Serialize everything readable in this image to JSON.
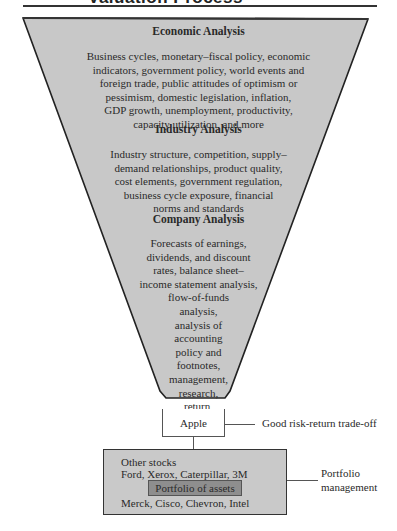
{
  "header": {
    "title": "Valuation Process"
  },
  "funnel": {
    "fill_color": "#c8c8c8",
    "stroke_color": "#222222",
    "sections": [
      {
        "heading": "Economic Analysis",
        "lines": [
          "Business cycles, monetary–fiscal policy, economic",
          "indicators, government policy, world events and",
          "foreign trade, public attitudes of optimism or",
          "pessimism, domestic legislation, inflation,",
          "GDP growth, unemployment, productivity,",
          "capacity utilization, and more"
        ]
      },
      {
        "heading": "Industry Analysis",
        "lines": [
          "Industry structure, competition, supply–",
          "demand relationships, product quality,",
          "cost elements, government regulation,",
          "business cycle exposure, financial",
          "norms and standards"
        ]
      },
      {
        "heading": "Company Analysis",
        "lines": [
          "Forecasts of earnings,",
          "dividends, and discount",
          "rates, balance sheet–",
          "income statement analysis,",
          "flow-of-funds",
          "analysis,",
          "analysis of",
          "accounting",
          "policy and",
          "footnotes,",
          "management,",
          "research,",
          "return,",
          "risk"
        ]
      }
    ]
  },
  "selection": {
    "stock": "Apple",
    "label": "Good risk-return trade-off"
  },
  "portfolio": {
    "line1": "Other stocks",
    "line2": "Ford, Xerox, Caterpillar, 3M",
    "center": "Portfolio of assets",
    "line3": "Merck, Cisco, Chevron, Intel",
    "fill_color": "#c9c9c9",
    "center_fill_color": "#8e8e8e",
    "label_line1": "Portfolio",
    "label_line2": "management"
  }
}
